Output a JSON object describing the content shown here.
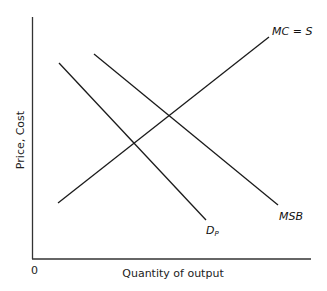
{
  "diagram": {
    "type": "economics-supply-demand",
    "axes": {
      "y_label": "Price, Cost",
      "x_label": "Quantity of output",
      "origin_label": "0"
    },
    "curves": [
      {
        "id": "mc",
        "label": "MC = S",
        "x1": 58,
        "y1": 203,
        "x2": 269,
        "y2": 37
      },
      {
        "id": "msb",
        "label": "MSB",
        "x1": 94,
        "y1": 54,
        "x2": 278,
        "y2": 205
      },
      {
        "id": "dp",
        "label_main": "D",
        "label_sub": "P",
        "x1": 59,
        "y1": 63,
        "x2": 206,
        "y2": 220
      }
    ],
    "colors": {
      "line": "#1a1a1a",
      "axis": "#333333"
    }
  }
}
